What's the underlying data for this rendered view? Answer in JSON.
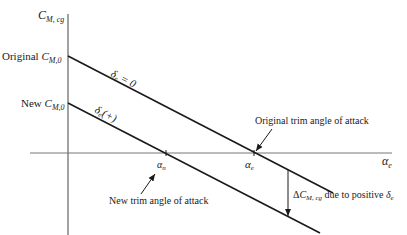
{
  "axes": {
    "y_label_main": "C",
    "y_label_sub": "M, cg",
    "x_label_main": "α",
    "x_label_sub": "e"
  },
  "intercepts": {
    "original_prefix": "Original ",
    "original_main": "C",
    "original_sub": "M,0",
    "new_prefix": "New ",
    "new_main": "C",
    "new_sub": "M,0"
  },
  "lines": {
    "original_label_main": "δ",
    "original_label_sub": "e",
    "original_label_rest": " = 0",
    "new_label_main": "δ",
    "new_label_sub": "e",
    "new_label_rest": "(+)"
  },
  "trim_points": {
    "alpha_n_main": "α",
    "alpha_n_sub": "n",
    "alpha_e_main": "α",
    "alpha_e_sub": "e",
    "original_trim_label": "Original trim angle of attack",
    "new_trim_label": "New trim angle of attack"
  },
  "delta": {
    "prefix": "Δ",
    "main": "C",
    "sub": "M, cg",
    "rest": " due to positive ",
    "delta_main": "δ",
    "delta_sub": "e"
  },
  "colors": {
    "line": "#1a1a1a",
    "axis": "#555555",
    "background": "#ffffff"
  }
}
